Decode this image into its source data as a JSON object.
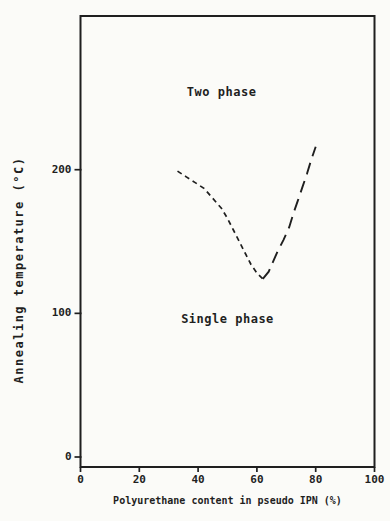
{
  "page": {
    "background": "#fbfbf8",
    "ink": "#1f1f1f"
  },
  "chart_data": {
    "type": "line",
    "title": "",
    "xlabel": "Polyurethane content in pseudo IPN (%)",
    "ylabel": "Annealing temperature (°C)",
    "xlim": [
      0,
      100
    ],
    "ylim": [
      0,
      307
    ],
    "x_ticks": [
      0,
      20,
      40,
      60,
      80,
      100
    ],
    "y_ticks": [
      0,
      100,
      200
    ],
    "grid": false,
    "legend": "none",
    "frame": "full-box",
    "annotations": [
      {
        "id": "two-phase",
        "text": "Two phase",
        "x": 48,
        "y": 254
      },
      {
        "id": "single-phase",
        "text": "Single phase",
        "x": 50,
        "y": 96
      }
    ],
    "series": [
      {
        "name": "phase-boundary-left",
        "style": "dashed-short",
        "points": [
          [
            33,
            199
          ],
          [
            36,
            195
          ],
          [
            39,
            191
          ],
          [
            42,
            187
          ],
          [
            45,
            180
          ],
          [
            48,
            173
          ],
          [
            50,
            166
          ],
          [
            52,
            158
          ],
          [
            54,
            150
          ],
          [
            56,
            142
          ],
          [
            58,
            134
          ],
          [
            60,
            128
          ],
          [
            61.5,
            125
          ],
          [
            62,
            124
          ]
        ]
      },
      {
        "name": "phase-boundary-right",
        "style": "dashed-long",
        "points": [
          [
            62,
            124
          ],
          [
            64,
            129
          ],
          [
            65.5,
            136
          ],
          [
            67,
            143
          ],
          [
            69,
            151
          ],
          [
            71,
            160
          ],
          [
            72.5,
            170
          ],
          [
            74,
            179
          ],
          [
            75.5,
            188
          ],
          [
            77,
            197
          ],
          [
            78.5,
            207
          ],
          [
            80,
            216
          ]
        ]
      }
    ]
  }
}
